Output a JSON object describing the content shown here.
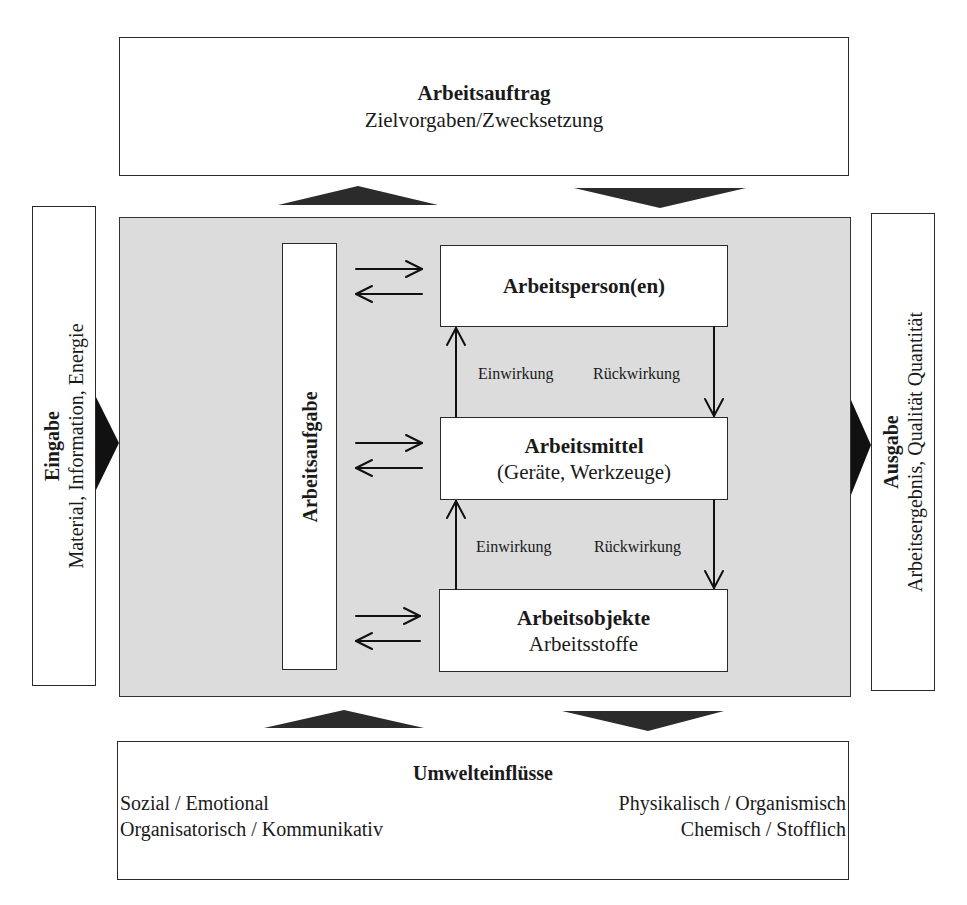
{
  "top_box": {
    "title": "Arbeitsauftrag",
    "subtitle": "Zielvorgaben/Zwecksetzung"
  },
  "left_box": {
    "title": "Eingabe",
    "subtitle": "Material, Information, Energie"
  },
  "right_box": {
    "title": "Ausgabe",
    "subtitle": "Arbeitsergebnis, Qualität Quantität"
  },
  "task_box": {
    "title": "Arbeitsaufgabe"
  },
  "elements": [
    {
      "title": "Arbeitsperson(en)",
      "subtitle": ""
    },
    {
      "title": "Arbeitsmittel",
      "subtitle": "(Geräte, Werkzeuge)"
    },
    {
      "title": "Arbeitsobjekte",
      "subtitle": "Arbeitsstoffe"
    }
  ],
  "interactions": [
    {
      "up_label": "Einwirkung",
      "down_label": "Rückwirkung"
    },
    {
      "up_label": "Einwirkung",
      "down_label": "Rückwirkung"
    }
  ],
  "bottom_box": {
    "title": "Umwelteinflüsse",
    "left_lines": [
      "Sozial / Emotional",
      "Organisatorisch / Kommunikativ"
    ],
    "right_lines": [
      "Physikalisch / Organismisch",
      "Chemisch / Stofflich"
    ]
  },
  "colors": {
    "system_background": "#dcdcdc",
    "arrow_fill": "#2b2b2b",
    "border": "#2a2a2a"
  }
}
